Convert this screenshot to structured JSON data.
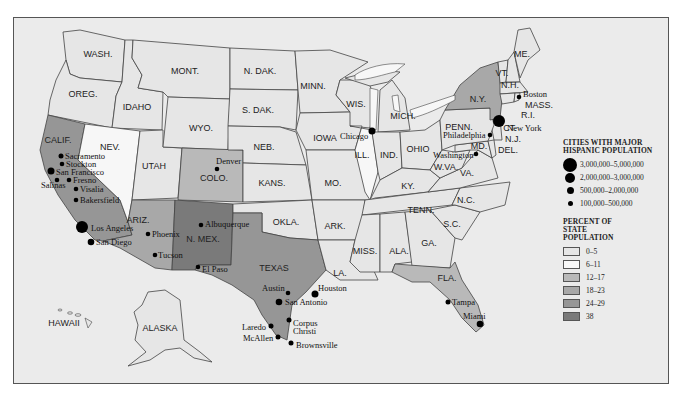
{
  "legend": {
    "cities_title": "CITIES WITH MAJOR HISPANIC POPULATION",
    "city_sizes": [
      {
        "label": "3,000,000–5,000,000",
        "size": 14
      },
      {
        "label": "2,000,000–3,000,000",
        "size": 10
      },
      {
        "label": "500,000–2,000,000",
        "size": 7
      },
      {
        "label": "100,000–500,000",
        "size": 5
      }
    ],
    "percent_title": "PERCENT OF STATE POPULATION",
    "percent_bins": [
      {
        "label": "0–5",
        "color": "#e6e6e6"
      },
      {
        "label": "6–11",
        "color": "#f7f7f7"
      },
      {
        "label": "12–17",
        "color": "#b9b9b9"
      },
      {
        "label": "18–23",
        "color": "#a8a8a8"
      },
      {
        "label": "24–29",
        "color": "#969696"
      },
      {
        "label": "38",
        "color": "#7a7a7a"
      }
    ]
  },
  "states": {
    "wash": "WASH.",
    "oreg": "OREG.",
    "calif": "CALIF.",
    "idaho": "IDAHO",
    "nev": "NEV.",
    "mont": "MONT.",
    "wyo": "WYO.",
    "utah": "UTAH",
    "colo": "COLO.",
    "ariz": "ARIZ.",
    "nmex": "N. MEX.",
    "ndak": "N. DAK.",
    "sdak": "S. DAK.",
    "neb": "NEB.",
    "kans": "KANS.",
    "okla": "OKLA.",
    "texas": "TEXAS",
    "minn": "MINN.",
    "iowa": "IOWA",
    "mo": "MO.",
    "ark": "ARK.",
    "la": "LA.",
    "wis": "WIS.",
    "ill": "ILL.",
    "mich": "MICH.",
    "ind": "IND.",
    "ohio": "OHIO",
    "ky": "KY.",
    "tenn": "TENN.",
    "miss": "MISS.",
    "ala": "ALA.",
    "ga": "GA.",
    "fla": "FLA.",
    "sc": "S.C.",
    "nc": "N.C.",
    "va": "VA.",
    "wva": "W.VA.",
    "md": "MD.",
    "del": "DEL.",
    "nj": "N.J.",
    "penn": "PENN.",
    "ny": "N.Y.",
    "ct": "CT.",
    "ri": "R.I.",
    "mass": "MASS.",
    "vt": "VT.",
    "nh": "N.H.",
    "me": "ME.",
    "alaska": "ALASKA",
    "hawaii": "HAWAII"
  },
  "cities": {
    "sacramento": "Sacramento",
    "stockton": "Stockton",
    "san_francisco": "San Francisco",
    "salinas": "Salinas",
    "fresno": "Fresno",
    "visalia": "Visalia",
    "bakersfield": "Bakersfield",
    "los_angeles": "Los Angeles",
    "san_diego": "San Diego",
    "phoenix": "Phoenix",
    "tucson": "Tucson",
    "denver": "Denver",
    "albuquerque": "Albuquerque",
    "el_paso": "El Paso",
    "austin": "Austin",
    "houston": "Houston",
    "san_antonio": "San Antonio",
    "corpus": "Corpus",
    "christi": "Christi",
    "laredo": "Laredo",
    "mcallen": "McAllen",
    "brownsville": "Brownsville",
    "chicago": "Chicago",
    "new_york": "New York",
    "boston": "Boston",
    "philadelphia": "Philadelphia",
    "washington": "Washington",
    "tampa": "Tampa",
    "miami": "Miami"
  }
}
